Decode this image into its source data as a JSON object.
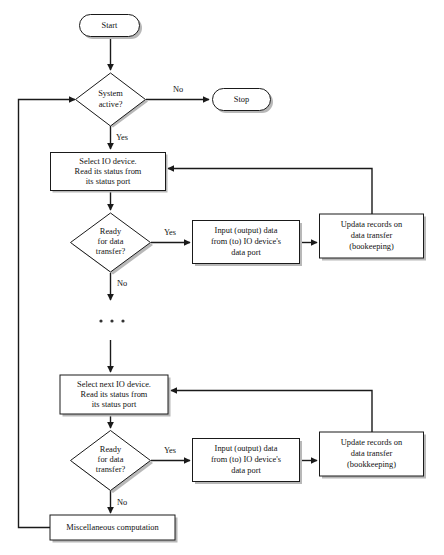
{
  "diagram": {
    "background_color": "#ffffff",
    "line_color": "#1a1a1a",
    "shadow_color": "#b8b8b8",
    "nodes": {
      "start": {
        "label": "Start",
        "shape": "terminator"
      },
      "stop": {
        "label": "Stop",
        "shape": "terminator"
      },
      "system_active": {
        "label_line1": "System",
        "label_line2": "active?",
        "shape": "decision"
      },
      "select_io": {
        "line1": "Select IO device.",
        "line2": "Read its status from",
        "line3": "its status port",
        "shape": "process"
      },
      "ready_1": {
        "line1": "Ready",
        "line2": "for data",
        "line3": "transfer?",
        "shape": "decision"
      },
      "input_output_1": {
        "line1": "Input (output) data",
        "line2": "from (to) IO device's",
        "line3": "data port",
        "shape": "process"
      },
      "update_records_1": {
        "line1": "Updata records on",
        "line2": "data transfer",
        "line3": "(bookeeping)",
        "shape": "process"
      },
      "select_next_io": {
        "line1": "Select next IO device.",
        "line2": "Read its status from",
        "line3": "its status port",
        "shape": "process"
      },
      "ready_2": {
        "line1": "Ready",
        "line2": "for data",
        "line3": "transfer?",
        "shape": "decision"
      },
      "input_output_2": {
        "line1": "Input (output) data",
        "line2": "from (to) IO device's",
        "line3": "data port",
        "shape": "process"
      },
      "update_records_2": {
        "line1": "Update records on",
        "line2": "data transfer",
        "line3": "(bookkeeping)",
        "shape": "process"
      },
      "misc_computation": {
        "label": "Miscellaneous computation",
        "shape": "process"
      },
      "ellipsis": {
        "label": "...",
        "shape": "continuation"
      }
    },
    "edge_labels": {
      "no_to_stop": "No",
      "yes_to_select_io": "Yes",
      "yes_ready_1": "Yes",
      "no_ready_1": "No",
      "yes_ready_2": "Yes",
      "no_ready_2": "No"
    }
  }
}
